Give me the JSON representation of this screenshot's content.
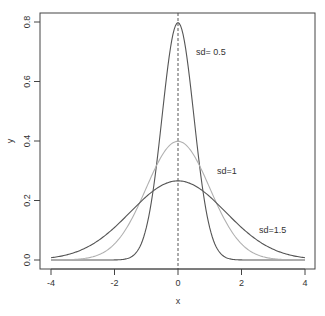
{
  "chart_data": {
    "type": "line",
    "title": "",
    "xlabel": "x",
    "ylabel": "y",
    "xlim": [
      -4,
      4
    ],
    "ylim": [
      0,
      0.8
    ],
    "x_ticks": [
      "-4",
      "-2",
      "0",
      "2",
      "4"
    ],
    "y_ticks": [
      "0.0",
      "0.2",
      "0.4",
      "0.6",
      "0.8"
    ],
    "grid": false,
    "legend": null,
    "vline": {
      "x": 0,
      "style": "dashed"
    },
    "series": [
      {
        "name": "sd=0.5",
        "mean": 0,
        "sd": 0.5,
        "peak": 0.798,
        "color": "#555555"
      },
      {
        "name": "sd=1",
        "mean": 0,
        "sd": 1,
        "peak": 0.399,
        "color": "#b0b0b0"
      },
      {
        "name": "sd=1.5",
        "mean": 0,
        "sd": 1.5,
        "peak": 0.266,
        "color": "#555555"
      }
    ],
    "annotations": [
      {
        "text": "sd= 0.5",
        "x": 0.6,
        "y": 0.7
      },
      {
        "text": "sd=1",
        "x": 1.3,
        "y": 0.3
      },
      {
        "text": "sd=1.5",
        "x": 2.6,
        "y": 0.1
      }
    ]
  },
  "labels": {
    "xlabel": "x",
    "ylabel": "y",
    "xticks": [
      "-4",
      "-2",
      "0",
      "2",
      "4"
    ],
    "yticks": [
      "0.0",
      "0.2",
      "0.4",
      "0.6",
      "0.8"
    ],
    "annot_sd05": "sd= 0.5",
    "annot_sd1": "sd=1",
    "annot_sd15": "sd=1.5"
  }
}
